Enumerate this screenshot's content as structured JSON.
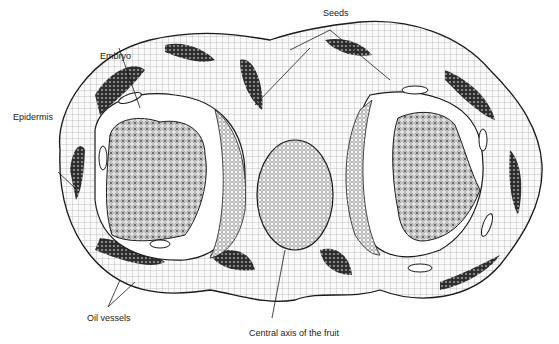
{
  "diagram": {
    "labels": {
      "seeds": "Seeds",
      "embryo": "Embryo",
      "epidermis": "Epidermis",
      "oil_vessels": "Oil vessels",
      "central_axis": "Central axis of the fruit"
    },
    "colors": {
      "ink": "#1a1a1a",
      "background": "#ffffff",
      "tissue_fill": "#f4f4f4",
      "dark_patch": "#3a3a3a",
      "embryo_fill": "#bdbdbd"
    }
  }
}
